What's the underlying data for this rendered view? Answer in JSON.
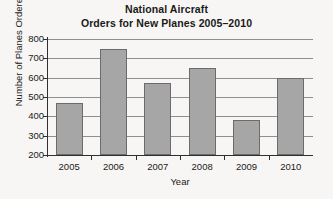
{
  "chart_data": {
    "type": "bar",
    "title_lines": [
      "National Aircraft",
      "Orders for New Planes 2005–2010"
    ],
    "xlabel": "Year",
    "ylabel": "Number of Planes Ordered",
    "categories": [
      "2005",
      "2006",
      "2007",
      "2008",
      "2009",
      "2010"
    ],
    "values": [
      470,
      750,
      570,
      650,
      380,
      600
    ],
    "ylim": [
      200,
      800
    ],
    "ytick_values": [
      200,
      300,
      400,
      500,
      600,
      700,
      800
    ],
    "ytick_labels": [
      "200",
      "300",
      "400",
      "500",
      "600",
      "700",
      "800"
    ],
    "grid": true,
    "legend": null,
    "bar_color": "#a6a6a6",
    "bar_border_color": "#6b6b6b",
    "axis_color": "#2f2f2f",
    "grid_color": "#8e8e8e",
    "background_color": "#f7f6f4"
  }
}
